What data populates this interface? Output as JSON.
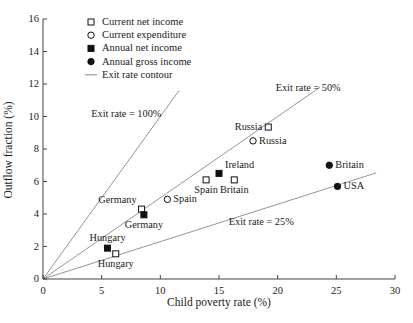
{
  "chart_data": {
    "type": "scatter",
    "title": "",
    "xlabel": "Child poverty rate (%)",
    "ylabel": "Outflow fraction (%)",
    "xlim": [
      0,
      30
    ],
    "ylim": [
      0,
      16
    ],
    "xticks": [
      0,
      5,
      10,
      15,
      20,
      25,
      30
    ],
    "yticks": [
      0,
      2,
      4,
      6,
      8,
      10,
      12,
      14,
      16
    ],
    "grid": false,
    "legend_position": "upper-left-inside",
    "legend": [
      {
        "marker": "open-square",
        "label": "Current net income"
      },
      {
        "marker": "open-circle",
        "label": "Current expenditure"
      },
      {
        "marker": "filled-square",
        "label": "Annual net income"
      },
      {
        "marker": "filled-circle",
        "label": "Annual gross income"
      },
      {
        "marker": "line",
        "label": "Exit rate contour"
      }
    ],
    "series": [
      {
        "name": "Current net income",
        "marker": "open-square",
        "points": [
          {
            "label": "Hungary",
            "x": 6.2,
            "y": 1.55,
            "label_pos": "below"
          },
          {
            "label": "Germany",
            "x": 8.4,
            "y": 4.3,
            "label_pos": "left-above"
          },
          {
            "label": "Spain",
            "x": 13.9,
            "y": 6.1,
            "label_pos": "below"
          },
          {
            "label": "Britain",
            "x": 16.3,
            "y": 6.1,
            "label_pos": "below"
          },
          {
            "label": "Russia",
            "x": 19.2,
            "y": 9.35,
            "label_pos": "left"
          }
        ]
      },
      {
        "name": "Current expenditure",
        "marker": "open-circle",
        "points": [
          {
            "label": "Spain",
            "x": 10.6,
            "y": 4.9,
            "label_pos": "right"
          },
          {
            "label": "Russia",
            "x": 17.9,
            "y": 8.5,
            "label_pos": "right"
          }
        ]
      },
      {
        "name": "Annual net income",
        "marker": "filled-square",
        "points": [
          {
            "label": "Hungary",
            "x": 5.5,
            "y": 1.9,
            "label_pos": "above"
          },
          {
            "label": "Germany",
            "x": 8.6,
            "y": 3.95,
            "label_pos": "below"
          },
          {
            "label": "Ireland",
            "x": 15.0,
            "y": 6.5,
            "label_pos": "right-above"
          }
        ]
      },
      {
        "name": "Annual gross income",
        "marker": "filled-circle",
        "points": [
          {
            "label": "Britain",
            "x": 24.4,
            "y": 7.0,
            "label_pos": "right"
          },
          {
            "label": "USA",
            "x": 25.1,
            "y": 5.7,
            "label_pos": "right"
          }
        ]
      }
    ],
    "contours": [
      {
        "label": "Exit rate = 100%",
        "slope": 1.0,
        "x_end": 11.6,
        "label_x": 7.1,
        "label_y": 10.15
      },
      {
        "label": "Exit rate = 50%",
        "slope": 0.5,
        "x_end": 23.6,
        "label_x": 22.6,
        "label_y": 11.75
      },
      {
        "label": "Exit rate = 25%",
        "slope": 0.23,
        "x_end": 28.4,
        "label_x": 18.6,
        "label_y": 3.5
      }
    ]
  },
  "colors": {
    "axis": "#444444",
    "marker": "#111111",
    "contour": "#7a7a7a",
    "text": "#1a1a1a"
  }
}
